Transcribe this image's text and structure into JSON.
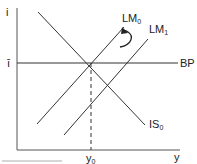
{
  "diagram": {
    "type": "IS-LM-BP diagram",
    "axes": {
      "y_label": "i",
      "x_label": "y",
      "y_tick_label": "ī",
      "x_tick_label": "y0"
    },
    "curves": [
      {
        "id": "LM0",
        "label": "LM",
        "subscript": "0"
      },
      {
        "id": "LM1",
        "label": "LM",
        "subscript": "1"
      },
      {
        "id": "IS0",
        "label": "IS",
        "subscript": "0"
      },
      {
        "id": "BP",
        "label": "BP",
        "subscript": ""
      }
    ],
    "annotations": {
      "arrow": "curved arrow from LM1 back toward LM0",
      "dashed_line": "vertical from equilibrium to y0"
    },
    "colors": {
      "line": "#222222",
      "background": "#ffffff"
    }
  }
}
